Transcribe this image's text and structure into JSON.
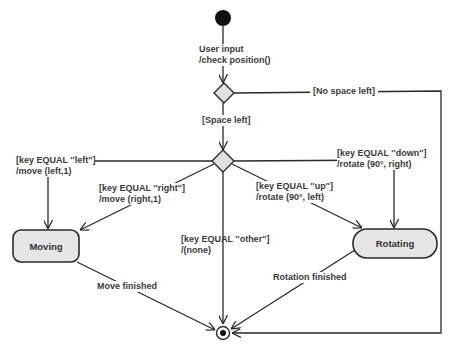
{
  "diagram": {
    "type": "UML activity/state diagram",
    "colors": {
      "line": "#2a2a2a",
      "state_fill": "#e6e6e6",
      "decision_fill": "#e0e0e0",
      "node": "#111111"
    },
    "nodes": {
      "initial": {
        "kind": "initial"
      },
      "decision_space": {
        "kind": "decision"
      },
      "decision_key": {
        "kind": "decision"
      },
      "moving": {
        "kind": "state",
        "label": "Moving"
      },
      "rotating": {
        "kind": "state",
        "label": "Rotating"
      },
      "final": {
        "kind": "final"
      }
    },
    "transitions": {
      "t_input": {
        "line1": "User input",
        "line2": "/check position()"
      },
      "t_no_space": {
        "line1": "[No space left]"
      },
      "t_space": {
        "line1": "[Space left]"
      },
      "t_left": {
        "line1": "[key EQUAL ''left'']",
        "line2": "/move (left,1)"
      },
      "t_right": {
        "line1": "[key EQUAL ''right'']",
        "line2": "/move (right,1)"
      },
      "t_other": {
        "line1": "[key EQUAL ''other'']",
        "line2": "/(none)"
      },
      "t_up": {
        "line1": "[key EQUAL ''up'']",
        "line2": "/rotate (90°, left)"
      },
      "t_down": {
        "line1": "[key EQUAL ''down'']",
        "line2": "/rotate (90°, right)"
      },
      "t_move_done": {
        "line1": "Move finished"
      },
      "t_rot_done": {
        "line1": "Rotation finished"
      }
    }
  }
}
